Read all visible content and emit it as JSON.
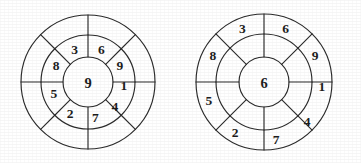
{
  "page": {
    "background_color": "#ffffff",
    "line_color": "#2b2b2b",
    "text_color": "#1d1d1d",
    "width": 361,
    "height": 163
  },
  "figures": [
    {
      "id": "left-wheel",
      "name": "left-wheel",
      "center_x": 88,
      "center_y": 82,
      "radii": {
        "outer": 67,
        "middle": 47,
        "inner": 25
      },
      "sector_count": 8,
      "spoke_angles_deg": [
        0,
        45,
        90,
        135,
        180,
        225,
        270,
        315
      ],
      "center_value": "9",
      "labeled_ring": "inner",
      "inner_ring_values": [
        "1",
        "9",
        "6",
        "3",
        "8",
        "5",
        "2",
        "7",
        "4"
      ],
      "outer_ring_values": [
        "",
        "",
        "",
        "",
        "",
        "",
        "",
        ""
      ],
      "inner_ring_labels": [
        {
          "value": "6",
          "angle_deg": 68
        },
        {
          "value": "3",
          "angle_deg": 112
        },
        {
          "value": "8",
          "angle_deg": 152
        },
        {
          "value": "5",
          "angle_deg": 198
        },
        {
          "value": "2",
          "angle_deg": 240
        },
        {
          "value": "7",
          "angle_deg": 282
        },
        {
          "value": "4",
          "angle_deg": 318
        },
        {
          "value": "1",
          "angle_deg": 356
        },
        {
          "value": "9",
          "angle_deg": 28
        }
      ]
    },
    {
      "id": "right-wheel",
      "name": "right-wheel",
      "center_x": 264,
      "center_y": 82,
      "radii": {
        "outer": 68,
        "middle": 48,
        "inner": 25
      },
      "sector_count": 8,
      "spoke_angles_deg": [
        0,
        45,
        90,
        135,
        180,
        225,
        270,
        315
      ],
      "center_value": "6",
      "labeled_ring": "outer",
      "inner_ring_values": [
        "",
        "",
        "",
        "",
        "",
        "",
        "",
        ""
      ],
      "outer_ring_values": [
        "1",
        "9",
        "6",
        "3",
        "8",
        "5",
        "2",
        "7",
        "4"
      ],
      "outer_ring_labels": [
        {
          "value": "6",
          "angle_deg": 68
        },
        {
          "value": "3",
          "angle_deg": 112
        },
        {
          "value": "8",
          "angle_deg": 152
        },
        {
          "value": "5",
          "angle_deg": 198
        },
        {
          "value": "2",
          "angle_deg": 240
        },
        {
          "value": "7",
          "angle_deg": 282
        },
        {
          "value": "4",
          "angle_deg": 318
        },
        {
          "value": "1",
          "angle_deg": 356
        },
        {
          "value": "9",
          "angle_deg": 28
        }
      ]
    }
  ]
}
